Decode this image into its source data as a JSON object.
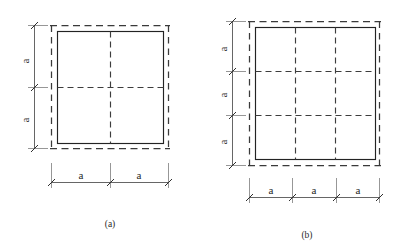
{
  "figure": {
    "background_color": "#ffffff",
    "line_color": "#232323",
    "dashed_color": "#3a3a3a",
    "dimension_color": "#4a4a4a",
    "dimension_symbol": "a"
  },
  "panels": [
    {
      "id": "panel-a",
      "caption": "(a)",
      "grid_divisions_x": 2,
      "grid_divisions_y": 2,
      "horizontal_dimension_labels": [
        "a",
        "a"
      ],
      "vertical_dimension_labels": [
        "a",
        "a"
      ]
    },
    {
      "id": "panel-b",
      "caption": "(b)",
      "grid_divisions_x": 3,
      "grid_divisions_y": 3,
      "horizontal_dimension_labels": [
        "a",
        "a",
        "a"
      ],
      "vertical_dimension_labels": [
        "a",
        "a",
        "a"
      ]
    }
  ],
  "labels": {
    "a_panel_h1": "a",
    "a_panel_h2": "a",
    "a_panel_v1": "a",
    "a_panel_v2": "a",
    "b_panel_h1": "a",
    "b_panel_h2": "a",
    "b_panel_h3": "a",
    "b_panel_v1": "a",
    "b_panel_v2": "a",
    "b_panel_v3": "a",
    "caption_a": "(a)",
    "caption_b": "(b)"
  }
}
